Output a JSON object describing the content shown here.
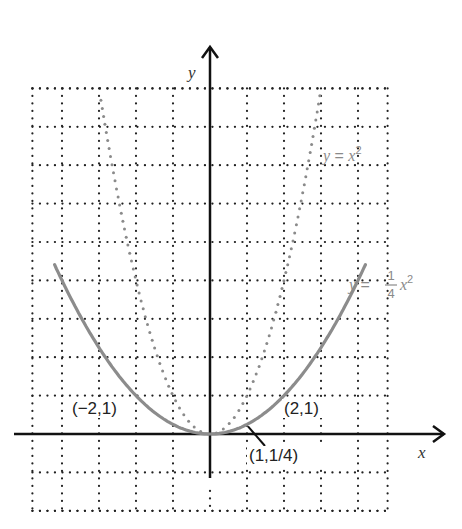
{
  "chart_data": {
    "type": "line",
    "title": "",
    "xlabel": "x",
    "ylabel": "y",
    "xlim": [
      -5,
      5
    ],
    "ylim": [
      -2,
      9
    ],
    "grid": true,
    "grid_style": "dotted",
    "series": [
      {
        "name": "y = x^2",
        "style": "dotted",
        "color": "#8a8a8a",
        "function": "x^2",
        "x_range": [
          -3,
          3
        ],
        "label_parts": {
          "lhs": "y",
          "eq": " = ",
          "var": "x",
          "exp": "2"
        }
      },
      {
        "name": "y = (1/4) x^2",
        "style": "solid",
        "color": "#8c8c8c",
        "function": "0.25*x^2",
        "x_range": [
          -4.2,
          4.2
        ],
        "label_parts": {
          "lhs": "y",
          "eq": " = ",
          "num": "1",
          "den": "4",
          "var": "x",
          "exp": "2"
        }
      }
    ],
    "annotations": [
      {
        "text": "(−2,1)",
        "x": -2,
        "y": 1
      },
      {
        "text": "(2,1)",
        "x": 2,
        "y": 1
      },
      {
        "text": "(1,1/4)",
        "x": 1,
        "y": 0.25,
        "arrow": true
      }
    ]
  }
}
